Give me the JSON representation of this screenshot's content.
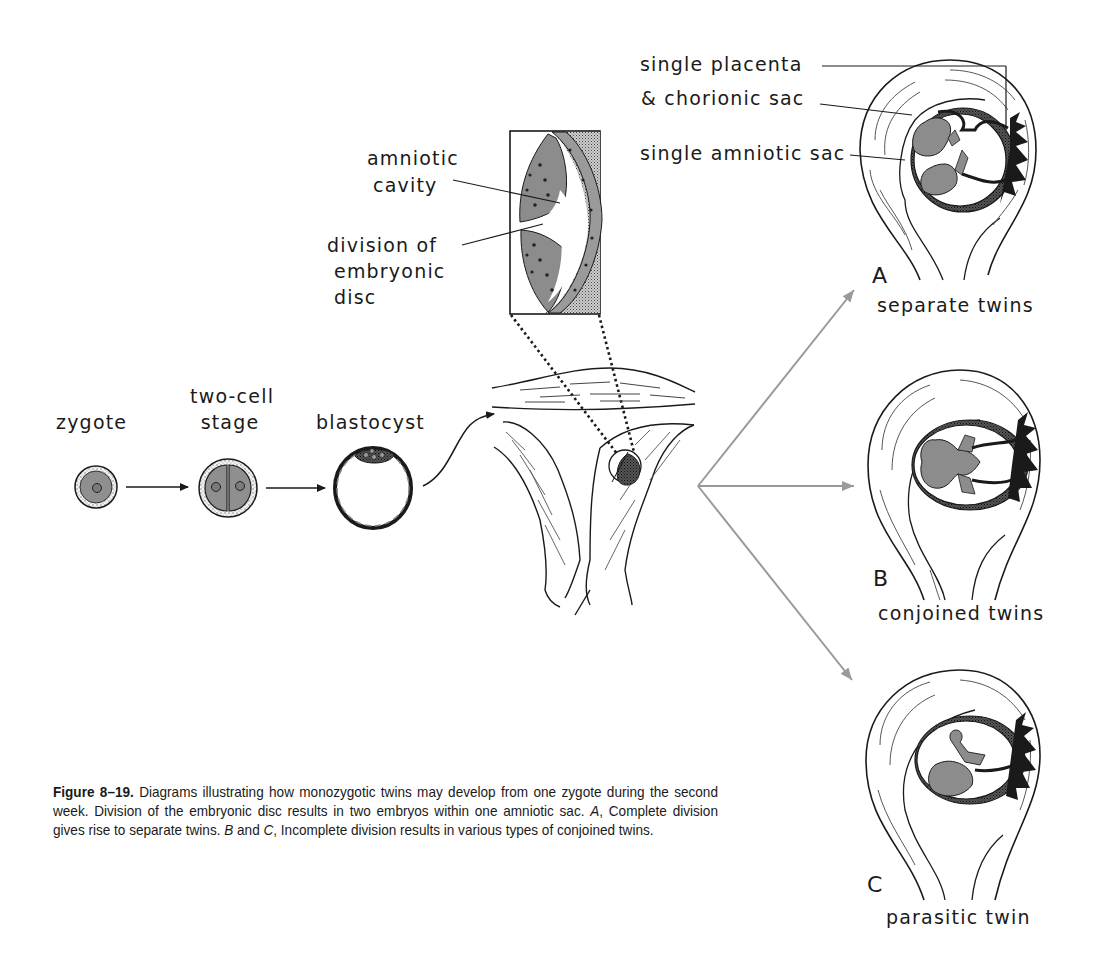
{
  "figure": {
    "stages": [
      {
        "id": "zygote",
        "label": "zygote"
      },
      {
        "id": "two-cell",
        "label_line1": "two-cell",
        "label_line2": "stage"
      },
      {
        "id": "blastocyst",
        "label": "blastocyst"
      }
    ],
    "inset_labels": {
      "amniotic_cavity_line1": "amniotic",
      "amniotic_cavity_line2": "cavity",
      "division_line1": "division of",
      "division_line2": "embryonic",
      "division_line3": "disc"
    },
    "panel_a_labels": {
      "placenta_line1": "single placenta",
      "placenta_line2": "& chorionic sac",
      "amniotic_sac": "single amniotic sac"
    },
    "panels": [
      {
        "letter": "A",
        "title": "separate twins"
      },
      {
        "letter": "B",
        "title": "conjoined twins"
      },
      {
        "letter": "C",
        "title": "parasitic twin"
      }
    ],
    "colors": {
      "ink": "#1a1a1a",
      "embryo_fill": "#8c8c8c",
      "cell_fill": "#9a9a9a",
      "arrow_gray": "#9a9a9a",
      "paper": "#ffffff"
    }
  },
  "caption": {
    "figure_number": "Figure 8–19.",
    "text_1": " Diagrams illustrating how monozygotic twins may develop from one zygote during the second week. Division of the embryonic disc results in two embryos within one amniotic sac. ",
    "a_ref": "A",
    "text_2": ", Complete division gives rise to separate twins. ",
    "b_ref": "B",
    "text_3": " and ",
    "c_ref": "C",
    "text_4": ", Incomplete division results in various types of conjoined twins."
  }
}
